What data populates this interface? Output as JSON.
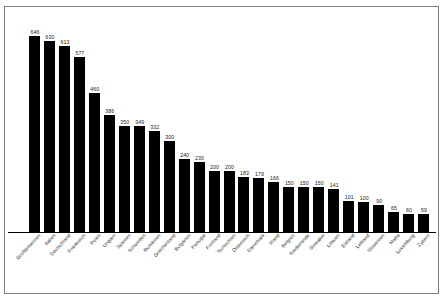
{
  "chart_data": {
    "type": "bar",
    "title": "",
    "subtitle": "",
    "xlabel": "",
    "ylabel": "",
    "ylim": [
      0,
      700
    ],
    "grid": false,
    "legend": false,
    "bar_color": "#000000",
    "background_color": "#ffffff",
    "border_color": "#7d7d7d",
    "value_labels_shown": true,
    "axis_tick_labels_shown": false,
    "categories": [
      "Großbritannien",
      "Italien",
      "Deutschland",
      "Frankreich",
      "Polen",
      "Ungarn",
      "Spanien",
      "Schweden",
      "Rumänien",
      "Griechenland",
      "Bulgarien",
      "Portugal",
      "Finnland",
      "Tschechien",
      "Österreich",
      "Dänemark",
      "Irland",
      "Belgien",
      "Niederlande",
      "Slowakei",
      "Litauen",
      "Estland",
      "Lettland",
      "Slowenien",
      "Malta",
      "Luxemburg",
      "Zypern"
    ],
    "values": [
      646,
      630,
      613,
      577,
      460,
      386,
      350,
      349,
      332,
      300,
      240,
      230,
      200,
      200,
      183,
      179,
      166,
      150,
      150,
      150,
      141,
      101,
      100,
      90,
      65,
      60,
      59
    ]
  }
}
